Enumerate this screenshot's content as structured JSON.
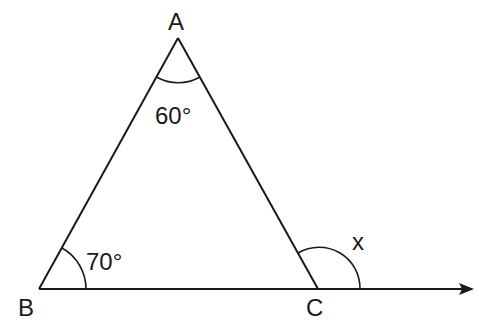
{
  "diagram": {
    "type": "triangle-exterior-angle",
    "vertices": {
      "A": {
        "label": "A"
      },
      "B": {
        "label": "B"
      },
      "C": {
        "label": "C"
      }
    },
    "angles": {
      "A": "60°",
      "B": "70°",
      "exterior_C": "x"
    },
    "colors": {
      "stroke": "#1a1a1a",
      "background": "#ffffff"
    }
  }
}
